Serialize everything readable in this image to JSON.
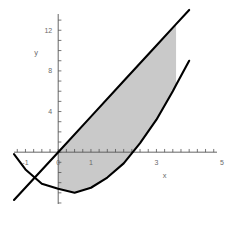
{
  "chart_data": {
    "type": "line",
    "title": "",
    "xlabel": "x",
    "ylabel": "y",
    "xlim": [
      -1.35,
      4.85
    ],
    "ylim": [
      -5.1,
      13.6
    ],
    "grid": false,
    "legend_position": "none",
    "xticks": [
      -1,
      0,
      1,
      3,
      5
    ],
    "xtick_labels": [
      "-1",
      "0",
      "1",
      "3",
      "5"
    ],
    "yticks": [
      4,
      8,
      12
    ],
    "ytick_labels": [
      "4",
      "8",
      "12"
    ],
    "minor_tick_step": 0.25,
    "shaded_region": {
      "label": "region between line and parabola",
      "fill_color": "#c9c9c9",
      "x_from": 0.0,
      "x_to": 3.6
    },
    "series": [
      {
        "name": "line",
        "type": "line",
        "color": "#000000",
        "equation": "y = 3.5x",
        "x": [
          -1.35,
          0,
          1,
          2,
          3,
          3.6,
          4.0
        ],
        "y": [
          -4.7,
          0,
          3.5,
          7.0,
          10.5,
          12.6,
          14.0
        ]
      },
      {
        "name": "parabola",
        "type": "line",
        "color": "#000000",
        "equation": "y = x^2 - x - 3.5 (approx)",
        "x": [
          -1.35,
          -1.0,
          -0.5,
          0,
          0.5,
          1.0,
          1.5,
          2.0,
          2.5,
          3.0,
          3.5,
          3.6,
          4.0
        ],
        "y": [
          -0.2,
          -1.7,
          -3.1,
          -3.6,
          -4.0,
          -3.5,
          -2.5,
          -1.1,
          0.9,
          3.2,
          6.0,
          6.6,
          9.0
        ]
      }
    ],
    "intersections": [
      {
        "x": 0.0,
        "y": 0.0
      },
      {
        "x": 3.6,
        "y": 12.6
      }
    ]
  },
  "axis": {
    "x_label": "x",
    "y_label": "y"
  }
}
